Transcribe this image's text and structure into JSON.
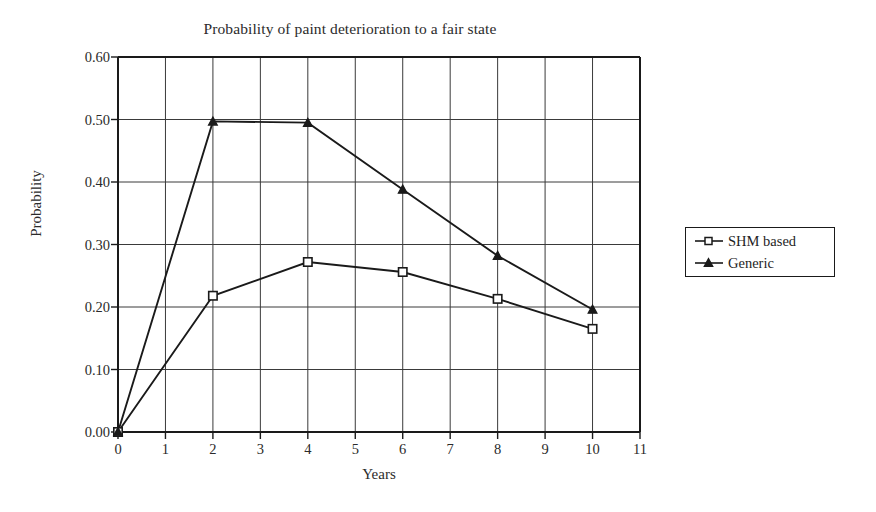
{
  "chart_data": {
    "type": "line",
    "title": "Probability of paint deterioration to a fair state",
    "xlabel": "Years",
    "ylabel": "Probability",
    "xlim": [
      0,
      11
    ],
    "ylim": [
      0,
      0.6
    ],
    "grid": true,
    "legend_position": "right-outside",
    "x_ticks": [
      0,
      1,
      2,
      3,
      4,
      5,
      6,
      7,
      8,
      9,
      10,
      11
    ],
    "x_tick_labels": [
      "0",
      "1",
      "2",
      "3",
      "4",
      "5",
      "6",
      "7",
      "8",
      "9",
      "10",
      "11"
    ],
    "y_ticks": [
      0.0,
      0.1,
      0.2,
      0.3,
      0.4,
      0.5,
      0.6
    ],
    "y_tick_labels": [
      "0.00",
      "0.10",
      "0.20",
      "0.30",
      "0.40",
      "0.50",
      "0.60"
    ],
    "x": [
      0,
      2,
      4,
      6,
      8,
      10
    ],
    "series": [
      {
        "name": "SHM based",
        "marker": "open-square",
        "color": "#1a1a1a",
        "values": [
          0.0,
          0.218,
          0.272,
          0.256,
          0.213,
          0.165
        ]
      },
      {
        "name": "Generic",
        "marker": "filled-triangle",
        "color": "#1a1a1a",
        "values": [
          0.0,
          0.497,
          0.495,
          0.388,
          0.282,
          0.196
        ]
      }
    ]
  },
  "legend": {
    "items": [
      {
        "label": "SHM based"
      },
      {
        "label": "Generic"
      }
    ]
  },
  "colors": {
    "background": "#ffffff",
    "axis": "#1a1a1a",
    "grid": "#3a3a3a",
    "text": "#2b2b2b",
    "series": "#1a1a1a"
  }
}
